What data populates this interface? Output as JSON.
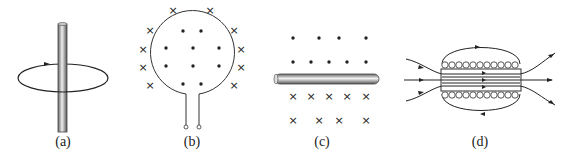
{
  "figure": {
    "panels": [
      {
        "id": "a",
        "label": "(a)",
        "description": "Straight vertical wire with circular magnetic field line and arrow"
      },
      {
        "id": "b",
        "label": "(b)",
        "description": "Circular current loop with two terminals; dots inside, crosses outside"
      },
      {
        "id": "c",
        "label": "(c)",
        "description": "Horizontal straight wire; dots above, crosses below"
      },
      {
        "id": "d",
        "label": "(d)",
        "description": "Solenoid with magnetic field lines through and around it"
      }
    ],
    "symbols": {
      "dot": "•",
      "cross": "×"
    },
    "colors": {
      "line": "#222222",
      "rod_light": "#e8e8e8",
      "rod_dark": "#777777"
    }
  }
}
